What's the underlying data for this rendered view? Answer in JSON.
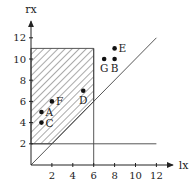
{
  "chart_data": {
    "type": "scatter",
    "title": "",
    "xlabel": "lx",
    "ylabel": "rx",
    "xlim": [
      0,
      13
    ],
    "ylim": [
      0,
      13
    ],
    "x_ticks": [
      2,
      4,
      6,
      8,
      10,
      12
    ],
    "y_ticks": [
      2,
      4,
      6,
      8,
      10,
      12
    ],
    "x_tick_labels": [
      "2",
      "4",
      "6",
      "8",
      "10",
      "12"
    ],
    "y_tick_labels": [
      "2",
      "4",
      "6",
      "8",
      "10",
      "12"
    ],
    "grid": false,
    "points": [
      {
        "name": "A",
        "x": 1,
        "y": 5,
        "label_side": "right"
      },
      {
        "name": "B",
        "x": 8,
        "y": 10,
        "label_side": "below"
      },
      {
        "name": "C",
        "x": 1,
        "y": 4,
        "label_side": "right"
      },
      {
        "name": "D",
        "x": 5,
        "y": 7,
        "label_side": "below"
      },
      {
        "name": "E",
        "x": 8,
        "y": 11,
        "label_side": "right"
      },
      {
        "name": "F",
        "x": 2,
        "y": 6,
        "label_side": "right"
      },
      {
        "name": "G",
        "x": 7,
        "y": 10,
        "label_side": "below"
      }
    ],
    "lines": [
      {
        "name": "diagonal",
        "from": [
          0,
          0
        ],
        "to": [
          12,
          12
        ]
      },
      {
        "name": "horizontal-rx-2",
        "from": [
          0,
          2
        ],
        "to": [
          12,
          2
        ]
      },
      {
        "name": "vertical-lx-6",
        "from": [
          6,
          0
        ],
        "to": [
          6,
          11
        ]
      }
    ],
    "shaded_region": {
      "pattern": "hatched",
      "vertices": [
        [
          0,
          2
        ],
        [
          2,
          2
        ],
        [
          6,
          6
        ],
        [
          6,
          11
        ],
        [
          0,
          11
        ]
      ]
    }
  }
}
